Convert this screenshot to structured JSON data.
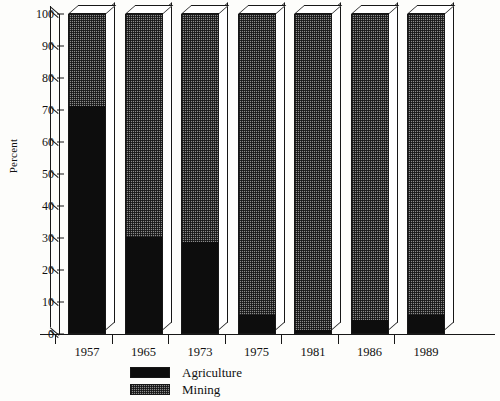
{
  "chart_data": {
    "type": "bar",
    "stacked": true,
    "title": "",
    "xlabel": "",
    "ylabel": "Percent",
    "ylim": [
      0,
      100
    ],
    "yticks": [
      0,
      10,
      20,
      30,
      40,
      50,
      60,
      70,
      80,
      90,
      100
    ],
    "grid": false,
    "legend_position": "bottom-center",
    "categories": [
      "1957",
      "1965",
      "1973",
      "1975",
      "1981",
      "1986",
      "1989"
    ],
    "series": [
      {
        "name": "Agriculture",
        "color": "#0d0d0d",
        "fill": "solid-black",
        "values": [
          71,
          30,
          28.5,
          5.5,
          1,
          4,
          5.5
        ]
      },
      {
        "name": "Mining",
        "color": "#8b8b8b",
        "fill": "dotted-checker",
        "values": [
          29,
          70,
          71.5,
          94.5,
          99,
          96,
          94.5
        ]
      }
    ]
  },
  "legend": {
    "items": [
      {
        "label": "Agriculture"
      },
      {
        "label": "Mining"
      }
    ]
  }
}
